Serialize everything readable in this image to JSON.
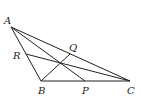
{
  "diagram": {
    "type": "geometry",
    "points": {
      "A": {
        "label": "A",
        "x": 11,
        "y": 27
      },
      "B": {
        "label": "B",
        "x": 41,
        "y": 81
      },
      "C": {
        "label": "C",
        "x": 130,
        "y": 81
      },
      "P": {
        "label": "P",
        "x": 85,
        "y": 81
      },
      "Q": {
        "label": "Q",
        "x": 70,
        "y": 54
      },
      "R": {
        "label": "R",
        "x": 26,
        "y": 54
      }
    },
    "segments": [
      [
        "A",
        "B"
      ],
      [
        "B",
        "C"
      ],
      [
        "A",
        "C"
      ],
      [
        "A",
        "P"
      ],
      [
        "B",
        "Q"
      ],
      [
        "C",
        "R"
      ]
    ]
  }
}
